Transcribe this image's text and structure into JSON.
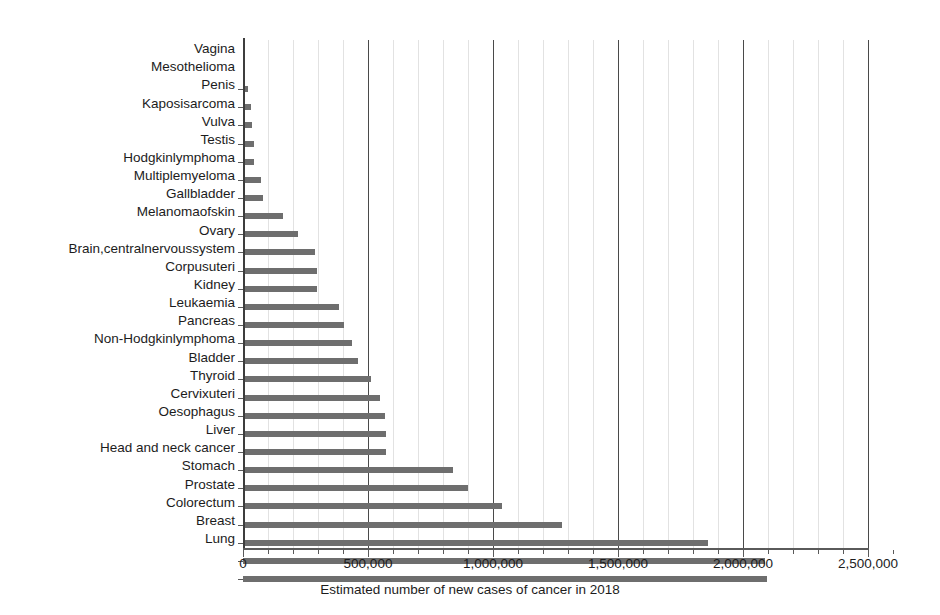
{
  "chart_data": {
    "type": "bar",
    "orientation": "horizontal",
    "title": "",
    "xlabel": "Estimated number of new cases of cancer in 2018",
    "ylabel": "",
    "xlim": [
      0,
      2600000
    ],
    "xticks": [
      0,
      500000,
      1000000,
      1500000,
      2000000,
      2500000
    ],
    "xticklabels": [
      "0",
      "500,000",
      "1,000,000",
      "1,500,000",
      "2,000,000",
      "2,500,000"
    ],
    "minor_tick_interval": 100000,
    "grid": "vertical-major-and-minor",
    "legend": null,
    "bar_color": "#6e6e6e",
    "categories": [
      "Vagina",
      "Mesothelioma",
      "Penis",
      "Kaposisarcoma",
      "Vulva",
      "Testis",
      "Hodgkinlymphoma",
      "Multiplemyeloma",
      "Gallbladder",
      "Melanomaofskin",
      "Ovary",
      "Brain,centralnervoussystem",
      "Corpusuteri",
      "Kidney",
      "Leukaemia",
      "Pancreas",
      "Non-Hodgkinlymphoma",
      "Bladder",
      "Thyroid",
      "Cervixuteri",
      "Oesophagus",
      "Liver",
      "Head and neck cancer",
      "Stomach",
      "Prostate",
      "Colorectum",
      "Breast",
      "Lung"
    ],
    "values": [
      18000,
      30000,
      34000,
      42000,
      44000,
      71000,
      80000,
      160000,
      219000,
      288000,
      295000,
      297000,
      382000,
      403000,
      437000,
      458000,
      510000,
      549000,
      567000,
      570000,
      572000,
      841000,
      900000,
      1034000,
      1276000,
      1860000,
      2089000,
      2094000
    ]
  }
}
